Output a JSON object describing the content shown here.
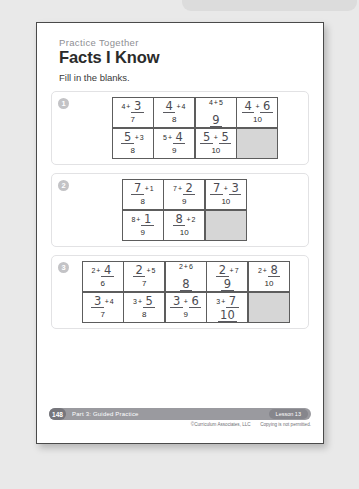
{
  "header": {
    "eyebrow": "Practice Together",
    "title": "Facts I Know",
    "instruction": "Fill in the blanks."
  },
  "exercises": [
    {
      "number": "1",
      "grid": [
        [
          {
            "a": "4",
            "a_written": false,
            "b": "3",
            "b_written": true,
            "sum": "7",
            "sum_written": false
          },
          {
            "a": "4",
            "a_written": true,
            "b": "4",
            "b_written": false,
            "sum": "8",
            "sum_written": false
          },
          {
            "a": "4",
            "a_written": false,
            "b": "5",
            "b_written": false,
            "sum": "9",
            "sum_written": true
          },
          {
            "a": "4",
            "a_written": true,
            "b": "6",
            "b_written": true,
            "sum": "10",
            "sum_written": false
          }
        ],
        [
          {
            "a": "5",
            "a_written": true,
            "b": "3",
            "b_written": false,
            "sum": "8",
            "sum_written": false
          },
          {
            "a": "5",
            "a_written": false,
            "b": "4",
            "b_written": true,
            "sum": "9",
            "sum_written": false
          },
          {
            "a": "5",
            "a_written": true,
            "b": "5",
            "b_written": true,
            "sum": "10",
            "sum_written": false
          },
          {
            "shaded": true
          }
        ]
      ]
    },
    {
      "number": "2",
      "grid": [
        [
          {
            "a": "7",
            "a_written": true,
            "b": "1",
            "b_written": false,
            "sum": "8",
            "sum_written": false
          },
          {
            "a": "7",
            "a_written": false,
            "b": "2",
            "b_written": true,
            "sum": "9",
            "sum_written": false
          },
          {
            "a": "7",
            "a_written": true,
            "b": "3",
            "b_written": true,
            "sum": "10",
            "sum_written": false
          }
        ],
        [
          {
            "a": "8",
            "a_written": false,
            "b": "1",
            "b_written": true,
            "sum": "9",
            "sum_written": false
          },
          {
            "a": "8",
            "a_written": true,
            "b": "2",
            "b_written": false,
            "sum": "10",
            "sum_written": false
          },
          {
            "shaded": true
          }
        ]
      ]
    },
    {
      "number": "3",
      "grid": [
        [
          {
            "a": "2",
            "a_written": false,
            "b": "4",
            "b_written": true,
            "sum": "6",
            "sum_written": false
          },
          {
            "a": "2",
            "a_written": true,
            "b": "5",
            "b_written": false,
            "sum": "7",
            "sum_written": false
          },
          {
            "a": "2",
            "a_written": false,
            "b": "6",
            "b_written": false,
            "sum": "8",
            "sum_written": true
          },
          {
            "a": "2",
            "a_written": true,
            "b": "7",
            "b_written": false,
            "sum": "9",
            "sum_written": true
          },
          {
            "a": "2",
            "a_written": false,
            "b": "8",
            "b_written": true,
            "sum": "10",
            "sum_written": false
          }
        ],
        [
          {
            "a": "3",
            "a_written": true,
            "b": "4",
            "b_written": false,
            "sum": "7",
            "sum_written": false
          },
          {
            "a": "3",
            "a_written": false,
            "b": "5",
            "b_written": true,
            "sum": "8",
            "sum_written": false
          },
          {
            "a": "3",
            "a_written": true,
            "b": "6",
            "b_written": true,
            "sum": "9",
            "sum_written": false
          },
          {
            "a": "3",
            "a_written": false,
            "b": "7",
            "b_written": true,
            "sum": "10",
            "sum_written": true
          },
          {
            "shaded": true
          }
        ]
      ]
    }
  ],
  "footer": {
    "page_number": "148",
    "part_label": "Part 3: Guided Practice",
    "lesson_label": "Lesson 13",
    "copyright": "©Curriculum Associates, LLC",
    "copying_notice": "Copying is not permitted."
  },
  "operators": {
    "plus": "+"
  },
  "colors": {
    "page_background": "#e9e9e9",
    "paper": "#ffffff",
    "shaded_cell": "#d6d6d6",
    "footer_bar": "#9a9a9f",
    "number_badge": "#c3c3c6",
    "handwriting": "#4b4b52"
  }
}
